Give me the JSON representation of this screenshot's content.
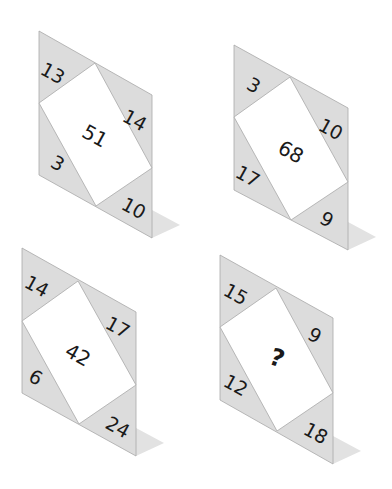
{
  "puzzle": {
    "colors": {
      "triangle": "#dcdcdc",
      "rectangle": "#ffffff",
      "edge": "#a8a8a8",
      "shadow": "#e2e2e2",
      "text": "#1a1a1a"
    },
    "tiles": [
      {
        "id": "top-left",
        "top_left": "13",
        "right": "14",
        "bottom_left": "3",
        "bottom_right": "10",
        "center": "51"
      },
      {
        "id": "top-right",
        "top_left": "3",
        "right": "10",
        "bottom_left": "17",
        "bottom_right": "9",
        "center": "68"
      },
      {
        "id": "bottom-left",
        "top_left": "14",
        "right": "17",
        "bottom_left": "6",
        "bottom_right": "24",
        "center": "42"
      },
      {
        "id": "bottom-right",
        "top_left": "15",
        "right": "9",
        "bottom_left": "12",
        "bottom_right": "18",
        "center": "?"
      }
    ]
  }
}
